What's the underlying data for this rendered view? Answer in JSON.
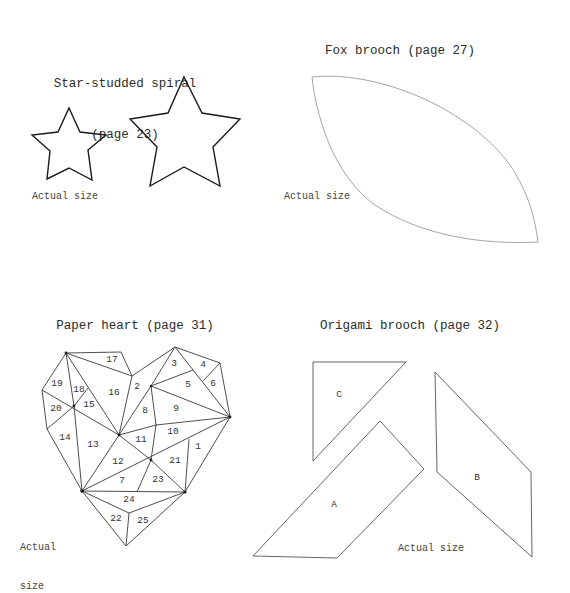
{
  "sections": {
    "stars": {
      "title_line1": "Star-studded spiral",
      "title_line2": "(page 23)",
      "note": "Actual size",
      "shapes": [
        "small-star",
        "large-star"
      ]
    },
    "fox": {
      "title": "Fox brooch (page 27)",
      "note": "Actual size",
      "shapes": [
        "leaf-shape"
      ]
    },
    "heart": {
      "title": "Paper heart (page 31)",
      "note_line1": "Actual",
      "note_line2": "size",
      "piece_numbers": [
        "1",
        "2",
        "3",
        "4",
        "5",
        "6",
        "7",
        "8",
        "9",
        "10",
        "11",
        "12",
        "13",
        "14",
        "15",
        "16",
        "17",
        "18",
        "19",
        "20",
        "21",
        "22",
        "23",
        "24",
        "25"
      ]
    },
    "origami": {
      "title": "Origami brooch (page 32)",
      "note": "Actual size",
      "pieces": {
        "a": "A",
        "b": "B",
        "c": "C"
      }
    }
  },
  "colors": {
    "background": "#ffffff",
    "star_stroke": "#1a1a1a",
    "fox_stroke": "#9a9a9a",
    "heart_stroke": "#3a3a3a",
    "origami_stroke": "#555555",
    "text": "#2b2b2b"
  }
}
